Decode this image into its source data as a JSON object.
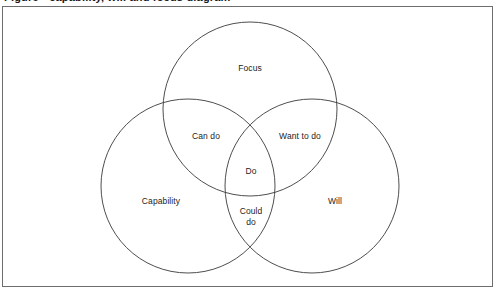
{
  "figure": {
    "clipped_heading_text": "Figure - capability, will and focus diagram",
    "border_color": "#6d6d6d",
    "stroke_color": "#3a3a3a",
    "text_color": "#1c1c1c",
    "background": "#ffffff"
  },
  "chart_data": {
    "type": "diagram",
    "diagram_type": "venn",
    "title": "",
    "set_count": 3,
    "sets": [
      {
        "id": "focus",
        "label": "Focus",
        "cx": 250,
        "cy": 109,
        "r": 87
      },
      {
        "id": "capability",
        "label": "Capability",
        "cx": 188,
        "cy": 186,
        "r": 87
      },
      {
        "id": "will",
        "label": "Will",
        "cx": 312,
        "cy": 186,
        "r": 87
      }
    ],
    "regions": [
      {
        "id": "focus-only",
        "members": [
          "focus"
        ],
        "label": "Focus",
        "x": 250,
        "y": 68,
        "lines": [
          "Focus"
        ]
      },
      {
        "id": "capability-only",
        "members": [
          "capability"
        ],
        "label": "Capability",
        "x": 161,
        "y": 201,
        "lines": [
          "Capability"
        ]
      },
      {
        "id": "will-only",
        "members": [
          "will"
        ],
        "label": "Will",
        "x": 335,
        "y": 201,
        "lines": [
          "Will"
        ]
      },
      {
        "id": "focus-capability",
        "members": [
          "focus",
          "capability"
        ],
        "label": "Can do",
        "x": 206,
        "y": 136,
        "lines": [
          "Can do"
        ]
      },
      {
        "id": "focus-will",
        "members": [
          "focus",
          "will"
        ],
        "label": "Want to do",
        "x": 300,
        "y": 136,
        "lines": [
          "Want to do"
        ]
      },
      {
        "id": "capability-will",
        "members": [
          "capability",
          "will"
        ],
        "label": "Could do",
        "x": 251,
        "y": 217,
        "lines": [
          "Could",
          "do"
        ]
      },
      {
        "id": "focus-capability-will",
        "members": [
          "focus",
          "capability",
          "will"
        ],
        "label": "Do",
        "x": 251,
        "y": 171,
        "lines": [
          "Do"
        ]
      }
    ]
  }
}
